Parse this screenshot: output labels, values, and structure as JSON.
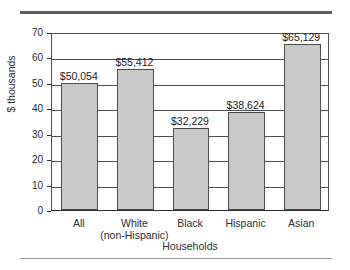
{
  "chart_data": {
    "type": "bar",
    "title": "",
    "subtitle": "",
    "xlabel": "Households",
    "ylabel": "$ thousands",
    "categories": [
      "All",
      "White (non-Hispanic)",
      "Black",
      "Hispanic",
      "Asian"
    ],
    "category_lines": [
      [
        "All"
      ],
      [
        "White",
        "(non-Hispanic)"
      ],
      [
        "Black"
      ],
      [
        "Hispanic"
      ],
      [
        "Asian"
      ]
    ],
    "values": [
      50.054,
      55.412,
      32.229,
      38.624,
      65.129
    ],
    "data_labels": [
      "$50,054",
      "$55,412",
      "$32,229",
      "$38,624",
      "$65,129"
    ],
    "ylim": [
      0,
      70
    ],
    "ytick_labels": [
      "0",
      "10",
      "20",
      "30",
      "40",
      "50",
      "60",
      "70"
    ],
    "ytick_values": [
      0,
      10,
      20,
      30,
      40,
      50,
      60,
      70
    ],
    "grid": "horizontal",
    "legend": "none",
    "bar_color": "#c9c9c9",
    "bar_border_color": "#4a4c4e",
    "axis_color": "#2b2d2f",
    "gridline_color": "#4c4f52",
    "rule_top_color": "#5d6063",
    "rule_bottom_color": "#9a9da0"
  }
}
